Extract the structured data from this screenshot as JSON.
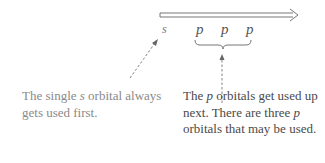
{
  "diagram": {
    "arrow": {
      "type": "double-line-arrow",
      "direction": "right"
    },
    "orbitals": {
      "s_label": "s",
      "p_labels": [
        "p",
        "p",
        "p"
      ]
    },
    "captions": {
      "left": {
        "before": "The single ",
        "italic": "s",
        "after": " orbital always gets used first."
      },
      "right": {
        "part1": "The ",
        "italic1": "p",
        "part2": " orbitals get used up next. There are three ",
        "italic2": "p",
        "part3": " orbitals that may be used."
      }
    },
    "colors": {
      "line": "#555555",
      "left_text": "#8a8a8a",
      "right_text": "#4a4a4a"
    }
  }
}
